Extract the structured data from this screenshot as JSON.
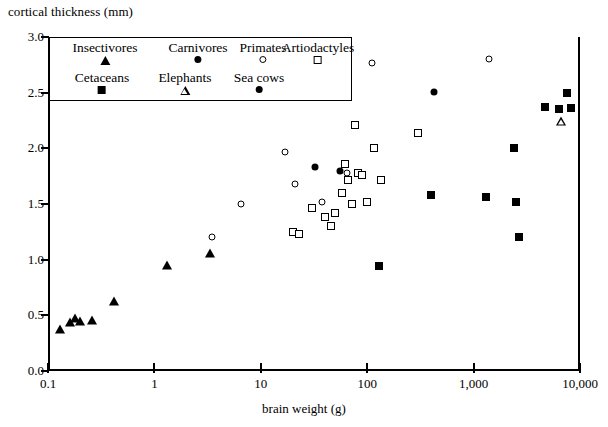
{
  "chart_data": {
    "type": "scatter",
    "title": "",
    "xlabel": "brain weight (g)",
    "ylabel": "cortical thickness (mm)",
    "xscale": "log",
    "xlim": [
      0.1,
      10000
    ],
    "ylim": [
      0.0,
      3.0
    ],
    "xticks": [
      "0.1",
      "1",
      "10",
      "100",
      "1,000",
      "10,000"
    ],
    "xtick_values": [
      0.1,
      1,
      10,
      100,
      1000,
      10000
    ],
    "yticks": [
      "0.0",
      "0.5",
      "1.0",
      "1.5",
      "2.0",
      "2.5",
      "3.0"
    ],
    "ytick_values": [
      0.0,
      0.5,
      1.0,
      1.5,
      2.0,
      2.5,
      3.0
    ],
    "grid": false,
    "legend_position": "top-left-inside",
    "series": [
      {
        "name": "Insectivores",
        "marker": "filled-triangle",
        "color": "#000000",
        "points": [
          [
            0.13,
            0.38
          ],
          [
            0.16,
            0.44
          ],
          [
            0.18,
            0.48
          ],
          [
            0.2,
            0.45
          ],
          [
            0.26,
            0.46
          ],
          [
            0.42,
            0.63
          ],
          [
            1.3,
            0.95
          ],
          [
            3.3,
            1.06
          ]
        ]
      },
      {
        "name": "Carnivores",
        "marker": "filled-circle",
        "color": "#000000",
        "points": [
          [
            32,
            1.83
          ],
          [
            55,
            1.8
          ],
          [
            420,
            2.51
          ]
        ]
      },
      {
        "name": "Primates",
        "marker": "open-circle",
        "color": "#000000",
        "points": [
          [
            3.5,
            1.2
          ],
          [
            6.5,
            1.5
          ],
          [
            17,
            1.97
          ],
          [
            21,
            1.68
          ],
          [
            38,
            1.52
          ],
          [
            64,
            1.78
          ],
          [
            110,
            2.77
          ],
          [
            1400,
            2.8
          ]
        ]
      },
      {
        "name": "Artiodactyles",
        "marker": "open-square",
        "color": "#000000",
        "points": [
          [
            20,
            1.25
          ],
          [
            23,
            1.23
          ],
          [
            30,
            1.46
          ],
          [
            40,
            1.38
          ],
          [
            46,
            1.3
          ],
          [
            50,
            1.42
          ],
          [
            58,
            1.6
          ],
          [
            62,
            1.86
          ],
          [
            66,
            1.72
          ],
          [
            72,
            1.5
          ],
          [
            76,
            2.21
          ],
          [
            82,
            1.78
          ],
          [
            90,
            1.76
          ],
          [
            100,
            1.52
          ],
          [
            115,
            2.0
          ],
          [
            135,
            1.72
          ],
          [
            300,
            2.14
          ]
        ]
      },
      {
        "name": "Cetaceans",
        "marker": "filled-square",
        "color": "#000000",
        "points": [
          [
            130,
            0.94
          ],
          [
            400,
            1.58
          ],
          [
            1300,
            1.56
          ],
          [
            2400,
            2.0
          ],
          [
            2500,
            1.52
          ],
          [
            2700,
            1.2
          ],
          [
            4700,
            2.37
          ],
          [
            6300,
            2.35
          ],
          [
            7600,
            2.5
          ],
          [
            8200,
            2.36
          ]
        ]
      },
      {
        "name": "Elephants",
        "marker": "open-triangle",
        "color": "#000000",
        "points": [
          [
            6600,
            2.25
          ]
        ]
      },
      {
        "name": "Sea cows",
        "marker": "filled-circle",
        "color": "#000000",
        "points": []
      }
    ]
  },
  "axes": {
    "ylabel_text": "cortical thickness (mm)",
    "xlabel_text": "brain weight (g)"
  },
  "legend": {
    "items": [
      {
        "label": "Insectivores",
        "marker": "filled-triangle"
      },
      {
        "label": "Carnivores",
        "marker": "filled-circle"
      },
      {
        "label": "Primates",
        "marker": "open-circle"
      },
      {
        "label": "Artiodactyles",
        "marker": "open-square"
      },
      {
        "label": "Cetaceans",
        "marker": "filled-square"
      },
      {
        "label": "Elephants",
        "marker": "open-triangle"
      },
      {
        "label": "Sea cows",
        "marker": "filled-circle"
      }
    ]
  }
}
